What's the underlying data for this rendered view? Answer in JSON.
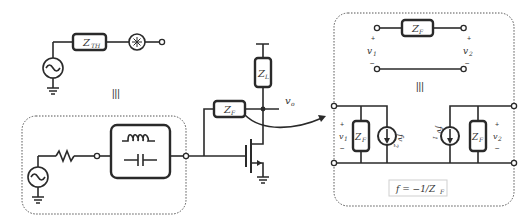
{
  "diagram": {
    "thevenin": {
      "impedance_label": "Z",
      "impedance_sub": "TH",
      "equiv_symbol": "|||"
    },
    "matching_network": {
      "components": [
        "resistor",
        "LC tank (inductor + capacitor)"
      ]
    },
    "amplifier": {
      "load_label": "Z",
      "load_sub": "L",
      "feedback_label": "Z",
      "feedback_sub": "F",
      "output_label": "v",
      "output_sub": "o"
    },
    "two_port": {
      "series_label": "Z",
      "series_sub": "F",
      "v1_label": "v",
      "v1_sub": "1",
      "v2_label": "v",
      "v2_sub": "2",
      "plus": "+",
      "minus": "−",
      "equiv_symbol": "|||",
      "shunt_left_label": "Z",
      "shunt_left_sub": "F",
      "shunt_right_label": "Z",
      "shunt_right_sub": "F",
      "src_left_label": "fv",
      "src_left_sub": "2",
      "src_right_label": "fv",
      "src_right_sub": "1",
      "formula": "f = −1/Z",
      "formula_sub": "F"
    }
  }
}
